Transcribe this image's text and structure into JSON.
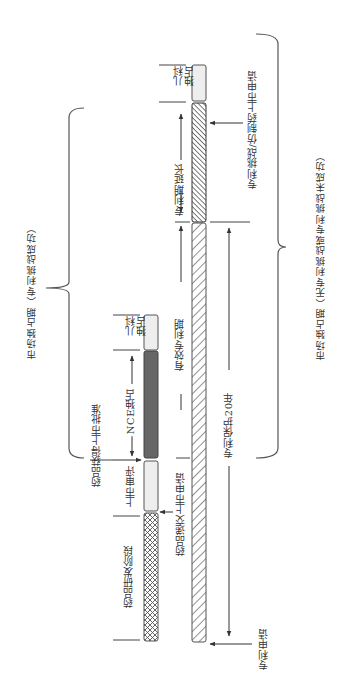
{
  "diagram": {
    "orientation": "rotated-90-ccw",
    "colors": {
      "line": "#444444",
      "pediatric_fill": "#eeeeee",
      "review_fill": "#eeeeee",
      "nce_fill": "#666666",
      "hatch": "#555555",
      "text": "#333333"
    },
    "braces": {
      "left": {
        "label": "市场独占期（专利挑战成功）"
      },
      "right": {
        "label": "市场独占期（无专利挑战或专利挑战未成功）"
      }
    },
    "drug_track": {
      "segments": [
        {
          "id": "rd",
          "label": "药品研发阶段",
          "pattern": "crosshatch"
        },
        {
          "id": "review",
          "label": "上市审评",
          "pattern": "light"
        },
        {
          "id": "nce",
          "label": "NCE独占",
          "pattern": "dark"
        },
        {
          "id": "pediatric",
          "label": "儿科\n独占",
          "pattern": "light"
        }
      ],
      "events": {
        "submission": "药品递交上市申请",
        "approval": "药品获得上市批准"
      }
    },
    "patent_track": {
      "segments": [
        {
          "id": "patent",
          "label": "有效专利期",
          "pattern": "diagonal"
        },
        {
          "id": "extension",
          "label": "专利期延长",
          "pattern": "dense-diagonal"
        },
        {
          "id": "pediatric",
          "label": "儿科\n独占",
          "pattern": "light"
        }
      ],
      "protection_label": "专利保护20年",
      "events": {
        "patent_filing": "专利申请",
        "challenge": "专利挑战/仿制药上市申请"
      }
    }
  }
}
